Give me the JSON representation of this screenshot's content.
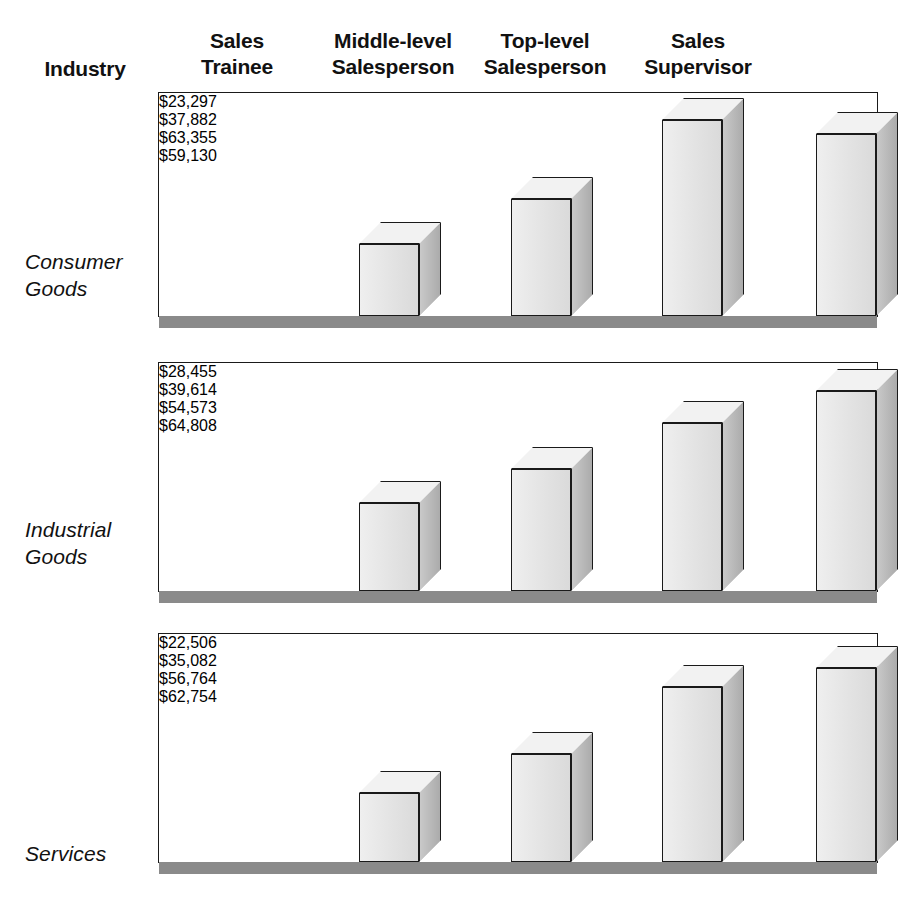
{
  "header": {
    "industry_label": "Industry",
    "columns": [
      {
        "label": "Sales\nTrainee"
      },
      {
        "label": "Middle-level\nSalesperson"
      },
      {
        "label": "Top-level\nSalesperson"
      },
      {
        "label": "Sales\nSupervisor"
      }
    ]
  },
  "colors": {
    "bar_front": "#e6e6e6",
    "bar_side": "#b9b9b9",
    "bar_top": "#f2f2f2",
    "outline": "#1a1a1a",
    "shadow": "#8a8a8a",
    "background": "#ffffff"
  },
  "rows": [
    {
      "label": "Consumer\nGoods",
      "bars": [
        {
          "label": "$23,297",
          "value": 23297
        },
        {
          "label": "$37,882",
          "value": 37882
        },
        {
          "label": "$63,355",
          "value": 63355
        },
        {
          "label": "$59,130",
          "value": 59130
        }
      ]
    },
    {
      "label": "Industrial\nGoods",
      "bars": [
        {
          "label": "$28,455",
          "value": 28455
        },
        {
          "label": "$39,614",
          "value": 39614
        },
        {
          "label": "$54,573",
          "value": 54573
        },
        {
          "label": "$64,808",
          "value": 64808
        }
      ]
    },
    {
      "label": "Services",
      "bars": [
        {
          "label": "$22,506",
          "value": 22506
        },
        {
          "label": "$35,082",
          "value": 35082
        },
        {
          "label": "$56,764",
          "value": 56764
        },
        {
          "label": "$62,754",
          "value": 62754
        }
      ]
    }
  ],
  "chart_data": {
    "type": "bar",
    "title": "",
    "xlabel": "",
    "ylabel": "",
    "categories": [
      "Sales Trainee",
      "Middle-level Salesperson",
      "Top-level Salesperson",
      "Sales Supervisor"
    ],
    "group_label": "Industry",
    "groups": [
      "Consumer Goods",
      "Industrial Goods",
      "Services"
    ],
    "series": [
      {
        "name": "Consumer Goods",
        "values": [
          23297,
          37882,
          63355,
          59130
        ]
      },
      {
        "name": "Industrial Goods",
        "values": [
          28455,
          39614,
          54573,
          64808
        ]
      },
      {
        "name": "Services",
        "values": [
          22506,
          35082,
          56764,
          62754
        ]
      }
    ],
    "value_format": "$#,###",
    "grid": false,
    "legend": "none",
    "panel_layout": "three stacked panels, one per industry group",
    "data_labels": true
  }
}
